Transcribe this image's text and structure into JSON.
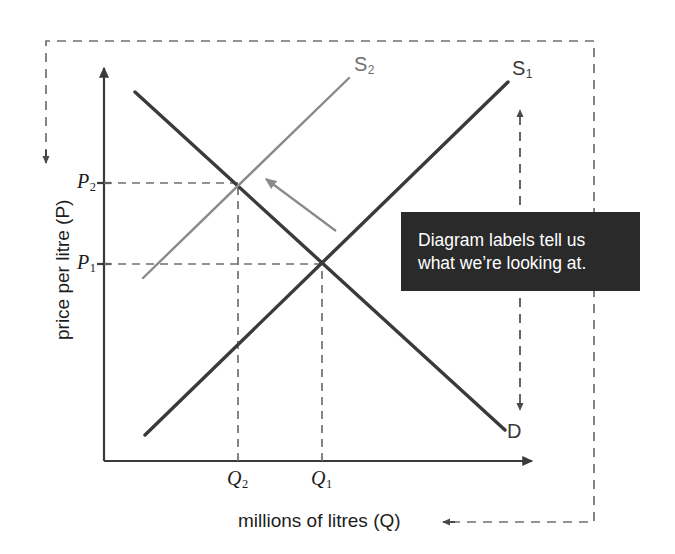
{
  "figure": {
    "type": "economics-supply-demand-diagram",
    "axes": {
      "y_label": "price per litre (P)",
      "x_label": "millions of litres (Q)",
      "y_ticks": [
        {
          "name": "P2-tick",
          "label_main": "P",
          "label_sub": "2",
          "value_y_px": 183
        },
        {
          "name": "P1-tick",
          "label_main": "P",
          "label_sub": "1",
          "value_y_px": 264
        }
      ],
      "x_ticks": [
        {
          "name": "Q2-tick",
          "label_main": "Q",
          "label_sub": "2",
          "value_x_px": 238
        },
        {
          "name": "Q1-tick",
          "label_main": "Q",
          "label_sub": "1",
          "value_x_px": 322
        }
      ]
    },
    "curves": [
      {
        "id": "demand",
        "label_main": "D",
        "label_sub": "",
        "color": "#3a3a3a",
        "role": "demand-curve"
      },
      {
        "id": "supply1",
        "label_main": "S",
        "label_sub": "1",
        "color": "#3a3a3a",
        "role": "original-supply-curve"
      },
      {
        "id": "supply2",
        "label_main": "S",
        "label_sub": "2",
        "color": "#8a8a8a",
        "role": "shifted-supply-curve"
      }
    ],
    "shift_arrow": {
      "name": "supply-shift-arrow",
      "color": "#8a8a8a",
      "direction": "up-left"
    },
    "annotation_arrows": [
      {
        "name": "y-axis-pointer-arrow",
        "direction": "down"
      },
      {
        "name": "x-axis-pointer-arrow",
        "direction": "left"
      },
      {
        "name": "curve-span-arrow",
        "direction": "both-vertical"
      }
    ],
    "callout": {
      "lines": [
        "Diagram labels tell us",
        "what we’re looking at."
      ],
      "background": "#2a2a2a",
      "text_color": "#ffffff"
    },
    "colors": {
      "ink": "#3a3a3a",
      "grey_curve": "#8a8a8a",
      "dashed": "#6f6f6f",
      "callout_bg": "#2a2a2a"
    }
  }
}
